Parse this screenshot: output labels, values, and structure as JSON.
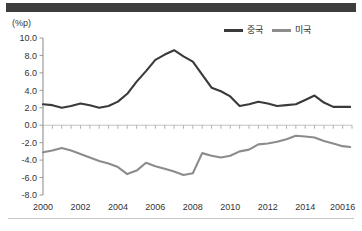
{
  "figure": {
    "unit_label": "(%p)",
    "top_bar_color": "#3d3d3d",
    "bottom_rule_color": "#c9c9c9",
    "background": "#ffffff"
  },
  "legend": {
    "position": "top-right",
    "entries": [
      {
        "label": "중국",
        "color": "#3a3a3a"
      },
      {
        "label": "미국",
        "color": "#8c8c8c"
      }
    ]
  },
  "chart_data": {
    "type": "line",
    "title": "",
    "subtitle": "",
    "xlabel": "",
    "ylabel": "(%p)",
    "ylim": [
      -8.0,
      10.0
    ],
    "xlim": [
      2000.0,
      2016.5
    ],
    "grid": false,
    "zero_line": true,
    "y_ticks": [
      "10.0",
      "8.0",
      "6.0",
      "4.0",
      "2.0",
      "0.0",
      "-2.0",
      "-4.0",
      "-6.0",
      "-8.0"
    ],
    "y_tick_values": [
      10.0,
      8.0,
      6.0,
      4.0,
      2.0,
      0.0,
      -2.0,
      -4.0,
      -6.0,
      -8.0
    ],
    "x_tick_labels": [
      "2000",
      "2002",
      "2004",
      "2006",
      "2008",
      "2010",
      "2012",
      "2014",
      "20016"
    ],
    "x_tick_values": [
      2000,
      2002,
      2004,
      2006,
      2008,
      2010,
      2012,
      2014,
      2016
    ],
    "x": [
      2000.0,
      2000.5,
      2001.0,
      2001.5,
      2002.0,
      2002.5,
      2003.0,
      2003.5,
      2004.0,
      2004.5,
      2005.0,
      2005.5,
      2006.0,
      2006.5,
      2007.0,
      2007.5,
      2008.0,
      2008.5,
      2009.0,
      2009.5,
      2010.0,
      2010.5,
      2011.0,
      2011.5,
      2012.0,
      2012.5,
      2013.0,
      2013.5,
      2014.0,
      2014.5,
      2015.0,
      2015.5,
      2016.0,
      2016.4
    ],
    "series": [
      {
        "name": "중국",
        "color": "#3a3a3a",
        "values": [
          2.4,
          2.3,
          2.0,
          2.2,
          2.5,
          2.3,
          2.0,
          2.2,
          2.7,
          3.6,
          5.0,
          6.2,
          7.5,
          8.1,
          8.6,
          7.9,
          7.3,
          5.8,
          4.3,
          3.9,
          3.3,
          2.2,
          2.4,
          2.7,
          2.5,
          2.2,
          2.3,
          2.4,
          2.9,
          3.4,
          2.6,
          2.1,
          2.1,
          2.1
        ]
      },
      {
        "name": "미국",
        "color": "#8c8c8c",
        "values": [
          -3.1,
          -2.9,
          -2.6,
          -2.9,
          -3.3,
          -3.7,
          -4.1,
          -4.4,
          -4.8,
          -5.6,
          -5.2,
          -4.3,
          -4.7,
          -5.0,
          -5.3,
          -5.7,
          -5.5,
          -3.2,
          -3.5,
          -3.7,
          -3.5,
          -3.0,
          -2.8,
          -2.2,
          -2.1,
          -1.9,
          -1.6,
          -1.2,
          -1.3,
          -1.4,
          -1.8,
          -2.1,
          -2.4,
          -2.5
        ]
      }
    ]
  }
}
